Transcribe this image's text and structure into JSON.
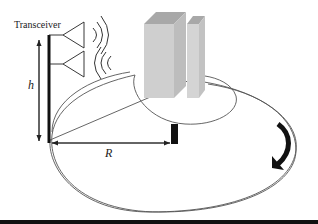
{
  "diagram": {
    "labels": {
      "transceiver": "Transceiver",
      "height": "h",
      "radius": "R"
    },
    "elements": [
      "transceiver-mast",
      "upper-antenna",
      "lower-antenna",
      "outgoing-radio-waves",
      "incoming-radio-waves",
      "tall-building",
      "short-building",
      "outer-ellipse-coverage",
      "inner-ellipse-region",
      "receiver-post",
      "rotation-arrow",
      "height-arrow",
      "radius-arrow"
    ],
    "colors": {
      "line": "#222222",
      "building_front": "#cfcfcf",
      "building_side": "#bdbdbd",
      "building_top": "#a8a8a8",
      "ellipse": "#555555"
    }
  }
}
